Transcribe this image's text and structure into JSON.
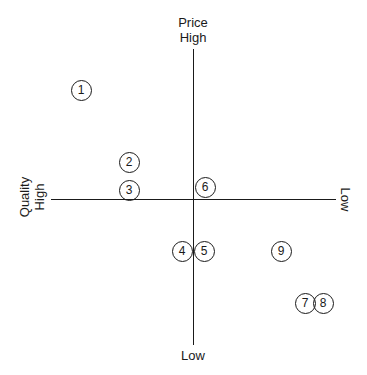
{
  "axes": {
    "top_label": "Price\nHigh",
    "top_line1": "Price",
    "top_line2": "High",
    "bottom_label": "Low",
    "left_line1": "Quality",
    "left_line2": "High",
    "right_label": "Low"
  },
  "markers": [
    {
      "id": "1",
      "x": 81,
      "y": 90
    },
    {
      "id": "2",
      "x": 129,
      "y": 162
    },
    {
      "id": "3",
      "x": 129,
      "y": 190
    },
    {
      "id": "4",
      "x": 182,
      "y": 251
    },
    {
      "id": "5",
      "x": 204,
      "y": 251
    },
    {
      "id": "6",
      "x": 205,
      "y": 187
    },
    {
      "id": "7",
      "x": 305,
      "y": 303
    },
    {
      "id": "8",
      "x": 323,
      "y": 303
    },
    {
      "id": "9",
      "x": 281,
      "y": 251
    }
  ],
  "colors": {
    "line": "#1a1a1a",
    "background": "#ffffff"
  }
}
